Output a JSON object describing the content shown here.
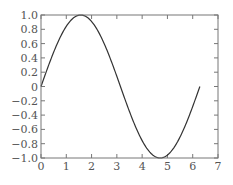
{
  "chart_data": {
    "type": "line",
    "title": "",
    "xlabel": "",
    "ylabel": "",
    "xlim": [
      0,
      7
    ],
    "ylim": [
      -1.0,
      1.0
    ],
    "grid": false,
    "legend": null,
    "x_ticks": [
      "0",
      "1",
      "2",
      "3",
      "4",
      "5",
      "6",
      "7"
    ],
    "y_ticks": [
      "1.0",
      "0.8",
      "0.6",
      "0.4",
      "0.2",
      "0",
      "-0.2",
      "-0.4",
      "-0.6",
      "-0.8",
      "-1.0"
    ],
    "series": [
      {
        "name": "sin(x)",
        "function": "sin(x)",
        "x_range": [
          0,
          6.283
        ],
        "x": [
          0,
          0.5,
          1.0,
          1.5708,
          2.0,
          2.5,
          3.1416,
          3.5,
          4.0,
          4.7124,
          5.0,
          5.5,
          6.0,
          6.283
        ],
        "values": [
          0,
          0.479,
          0.841,
          1.0,
          0.909,
          0.598,
          0,
          -0.351,
          -0.757,
          -1.0,
          -0.959,
          -0.706,
          -0.279,
          0
        ],
        "color": "#333333"
      }
    ]
  },
  "axes": {
    "frame_color": "#777777",
    "tick_color": "#777777",
    "label_color": "#555555"
  }
}
